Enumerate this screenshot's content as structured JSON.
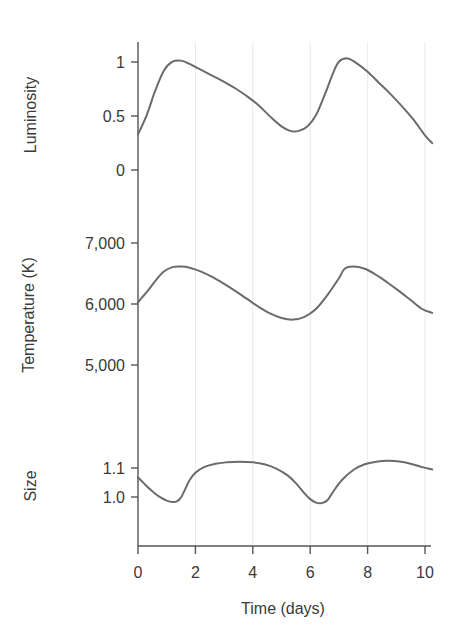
{
  "chart_data": {
    "type": "line",
    "title": "",
    "subtitle": "",
    "layout": "three stacked panels sharing one x-axis",
    "grid": "vertical gridlines only, at x = 2, 4, 6, 8, 10",
    "legend": "none",
    "xlabel": "Time (days)",
    "xticks": [
      "0",
      "2",
      "4",
      "6",
      "8",
      "10"
    ],
    "xtick_values": [
      0,
      2,
      4,
      6,
      8,
      10
    ],
    "xlim": [
      0,
      10.3
    ],
    "line_color": "#6b6b6b",
    "axis_color": "#555555",
    "grid_color": "#e8e8e8",
    "panels": [
      {
        "id": "luminosity",
        "ylabel": "Luminosity",
        "yticks": [
          "0",
          "0.5",
          "1"
        ],
        "ytick_values": [
          0,
          0.5,
          1
        ],
        "ylim": [
          -0.18,
          1.12
        ],
        "x": [
          0.0,
          0.3,
          0.6,
          0.9,
          1.2,
          1.5,
          1.8,
          2.1,
          2.4,
          2.7,
          3.0,
          3.4,
          3.8,
          4.2,
          4.6,
          5.0,
          5.3,
          5.6,
          5.9,
          6.2,
          6.5,
          6.8,
          7.0,
          7.3,
          7.6,
          8.0,
          8.4,
          8.8,
          9.2,
          9.6,
          10.0,
          10.25
        ],
        "y": [
          0.32,
          0.49,
          0.71,
          0.89,
          0.97,
          0.98,
          0.95,
          0.91,
          0.87,
          0.83,
          0.79,
          0.73,
          0.66,
          0.58,
          0.48,
          0.39,
          0.35,
          0.35,
          0.39,
          0.49,
          0.67,
          0.87,
          0.97,
          1.0,
          0.96,
          0.88,
          0.78,
          0.68,
          0.57,
          0.45,
          0.31,
          0.24
        ]
      },
      {
        "id": "temperature",
        "ylabel": "Temperature (K)",
        "yticks": [
          "5,000",
          "6,000",
          "7,000"
        ],
        "ytick_values": [
          5000,
          6000,
          7000
        ],
        "ylim": [
          4450,
          7350
        ],
        "x": [
          0.0,
          0.3,
          0.6,
          0.9,
          1.2,
          1.5,
          1.8,
          2.2,
          2.6,
          3.0,
          3.4,
          3.8,
          4.2,
          4.6,
          5.0,
          5.4,
          5.8,
          6.2,
          6.6,
          7.0,
          7.2,
          7.5,
          7.9,
          8.3,
          8.7,
          9.1,
          9.5,
          9.9,
          10.25
        ],
        "y": [
          6020,
          6200,
          6400,
          6570,
          6650,
          6660,
          6640,
          6570,
          6470,
          6350,
          6220,
          6080,
          5940,
          5820,
          5740,
          5710,
          5760,
          5900,
          6150,
          6450,
          6620,
          6660,
          6620,
          6510,
          6370,
          6220,
          6060,
          5900,
          5830
        ]
      },
      {
        "id": "size",
        "ylabel": "Size",
        "yticks": [
          "1.0",
          "1.1"
        ],
        "ytick_values": [
          1.0,
          1.1
        ],
        "ylim": [
          0.925,
          1.205
        ],
        "x": [
          0.0,
          0.2,
          0.4,
          0.6,
          0.8,
          1.0,
          1.2,
          1.35,
          1.5,
          1.65,
          1.8,
          2.0,
          2.3,
          2.7,
          3.1,
          3.5,
          4.0,
          4.4,
          4.8,
          5.2,
          5.5,
          5.8,
          6.0,
          6.2,
          6.4,
          6.6,
          6.8,
          7.1,
          7.5,
          7.9,
          8.3,
          8.7,
          9.1,
          9.5,
          9.9,
          10.25
        ],
        "y": [
          1.102,
          1.082,
          1.062,
          1.045,
          1.031,
          1.021,
          1.016,
          1.018,
          1.032,
          1.062,
          1.093,
          1.118,
          1.138,
          1.15,
          1.155,
          1.157,
          1.155,
          1.148,
          1.134,
          1.11,
          1.082,
          1.046,
          1.026,
          1.014,
          1.012,
          1.022,
          1.052,
          1.092,
          1.128,
          1.148,
          1.157,
          1.16,
          1.158,
          1.15,
          1.138,
          1.13
        ]
      }
    ]
  }
}
